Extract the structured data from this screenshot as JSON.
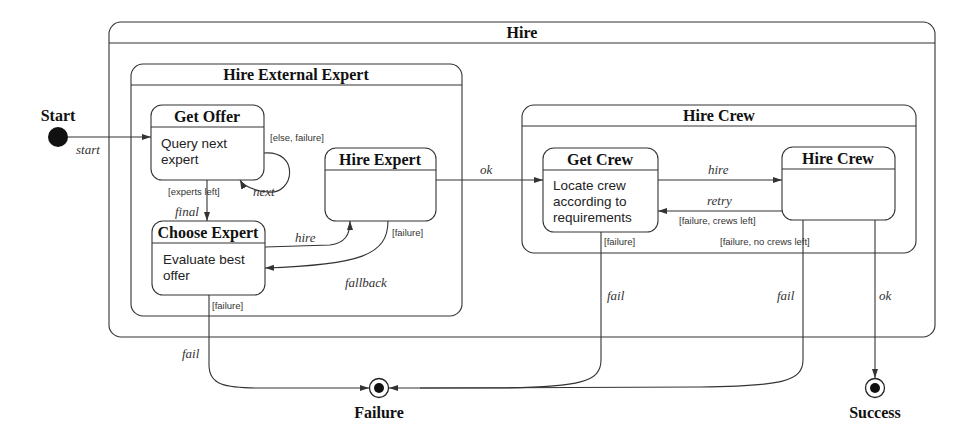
{
  "diagram": {
    "type": "statechart",
    "pseudo_states": {
      "start": {
        "label": "Start",
        "event": "start"
      },
      "failure": {
        "label": "Failure"
      },
      "success": {
        "label": "Success"
      }
    },
    "composite_states": {
      "hire": {
        "title": "Hire"
      },
      "hire_external_expert": {
        "title": "Hire External Expert"
      },
      "hire_crew_group": {
        "title": "Hire Crew"
      }
    },
    "states": {
      "get_offer": {
        "title": "Get Offer",
        "body_line1": "Query next",
        "body_line2": "expert"
      },
      "hire_expert": {
        "title": "Hire Expert"
      },
      "choose_expert": {
        "title": "Choose Expert",
        "body_line1": "Evaluate best",
        "body_line2": "offer"
      },
      "get_crew": {
        "title": "Get Crew",
        "body_line1": "Locate crew",
        "body_line2": "according to",
        "body_line3": "requirements"
      },
      "hire_crew": {
        "title": "Hire Crew"
      }
    },
    "transitions": {
      "start": {
        "event": "start"
      },
      "get_offer_guard_else": "[else, failure]",
      "get_offer_next": "next",
      "experts_left_guard": "[experts left]",
      "final": "final",
      "hire": "hire",
      "hire_expert_failure_guard": "[failure]",
      "fallback": "fallback",
      "choose_expert_failure_guard": "[failure]",
      "fail_choose": "fail",
      "ok_to_crew": "ok",
      "crew_hire": "hire",
      "retry": "retry",
      "retry_guard": "[failure, crews left]",
      "get_crew_failure_guard": "[failure]",
      "no_crews_guard": "[failure, no crews left]",
      "fail_get_crew": "fail",
      "fail_hire_crew": "fail",
      "ok_success": "ok"
    }
  }
}
